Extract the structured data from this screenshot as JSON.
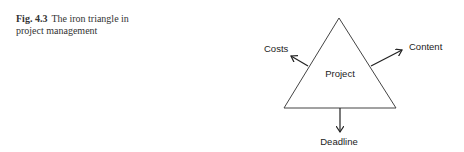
{
  "caption": {
    "label": "Fig. 4.3",
    "text": "The iron triangle in project management"
  },
  "diagram": {
    "center_label": "Project",
    "labels": {
      "top_left": "Costs",
      "top_right": "Content",
      "bottom": "Deadline"
    }
  }
}
